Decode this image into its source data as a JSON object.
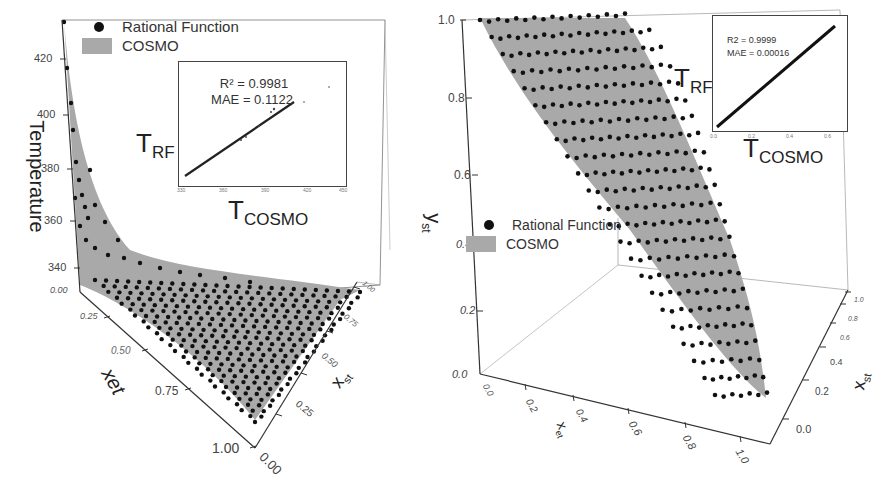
{
  "chart_data": [
    {
      "type": "scatter3d_surface",
      "panel": "left",
      "title": "",
      "zlabel": "Temperature",
      "xlabel": "xet",
      "ylabel": "xst",
      "z_ticks": [
        "340",
        "360",
        "380",
        "400",
        "420"
      ],
      "z_min_label": "0.00",
      "x_ticks": [
        "0.00",
        "0.25",
        "0.50",
        "0.75",
        "1.00"
      ],
      "y_ticks": [
        "0.00",
        "0.25",
        "0.50",
        "0.75",
        "1.00"
      ],
      "zlim": [
        330,
        432
      ],
      "legend": [
        {
          "name": "Rational Function",
          "marker": "dot",
          "color": "#111111"
        },
        {
          "name": "COSMO",
          "marker": "surface",
          "color": "#a9a9a9"
        }
      ],
      "description": "Temperature surface decreasing steeply from ~432 at xet=0, xst=0 toward ~345 plateau; rational function points overlay COSMO surface",
      "inset": {
        "type": "scatter",
        "xlabel": "T_COSMO",
        "ylabel": "T_RF",
        "x_ticks": [
          "330",
          "360",
          "390",
          "420",
          "450"
        ],
        "y_ticks": [
          "390",
          "420",
          "450"
        ],
        "stats": {
          "r2_label": "R² = 0.9981",
          "mae_label": "MAE = 0.1122"
        },
        "r2": 0.9981,
        "mae": 0.1122
      }
    },
    {
      "type": "scatter3d_surface",
      "panel": "right",
      "title": "",
      "zlabel": "yst",
      "xlabel": "xet",
      "ylabel": "xst",
      "z_ticks": [
        "0.0",
        "0.2",
        "0.4",
        "0.6",
        "0.8",
        "1.0"
      ],
      "x_ticks": [
        "0.0",
        "0.2",
        "0.4",
        "0.6",
        "0.8",
        "1.0"
      ],
      "y_ticks": [
        "0.0",
        "0.2",
        "0.4",
        "0.6",
        "0.8",
        "1.0"
      ],
      "zlim": [
        0,
        1
      ],
      "legend": [
        {
          "name": "Rational Function",
          "marker": "dot",
          "color": "#111111"
        },
        {
          "name": "COSMO",
          "marker": "surface",
          "color": "#a9a9a9"
        }
      ],
      "description": "Vapor composition yst surface rising from 0 at xst=0 to 1.0 plateau; rational function points overlay COSMO surface",
      "inset": {
        "type": "scatter",
        "xlabel": "T_COSMO",
        "ylabel": "T_RF",
        "x_ticks": [
          "0.0",
          "0.2",
          "0.4",
          "0.6"
        ],
        "y_ticks": [
          "0.0",
          "0.2",
          "0.4",
          "0.6"
        ],
        "stats": {
          "r2_label": "R2 = 0.9999",
          "mae_label": "MAE = 0.00016"
        },
        "r2": 0.9999,
        "mae": 0.00016
      }
    }
  ],
  "left": {
    "legend": {
      "item1": "Rational Function",
      "item2": "COSMO"
    },
    "z_axis_title": "Temperature",
    "z_ticks": [
      "420",
      "400",
      "380",
      "360",
      "340"
    ],
    "z_min": "0.00",
    "x_axis_title": "xet",
    "x_ticks": [
      "0.25",
      "0.50",
      "0.75",
      "1.00"
    ],
    "y_axis_title": "x",
    "y_axis_sub": "st",
    "y_ticks": [
      "0.00",
      "0.25",
      "0.50",
      "0.75",
      "1.00"
    ],
    "inset": {
      "r2": "R² = 0.9981",
      "mae": "MAE = 0.1122",
      "ylabel_main": "T",
      "ylabel_sub": "RF",
      "xlabel_main": "T",
      "xlabel_sub": "COSMO",
      "x_ticks": [
        "330",
        "360",
        "390",
        "420",
        "450"
      ],
      "y_ticks": [
        "390",
        "420",
        "450"
      ]
    }
  },
  "right": {
    "legend": {
      "item1": "Rational Function",
      "item2": "COSMO"
    },
    "z_axis_title": "y",
    "z_axis_sub": "st",
    "z_ticks": [
      "1.0",
      "0.8",
      "0.6",
      "0.4",
      "0.2",
      "0.0"
    ],
    "x_axis_title": "x",
    "x_axis_sub": "et",
    "x_ticks": [
      "0.0",
      "0.2",
      "0.4",
      "0.6",
      "0.8",
      "1.0"
    ],
    "y_axis_title": "x",
    "y_axis_sub": "st",
    "y_ticks": [
      "0.0",
      "0.2",
      "0.4",
      "0.6",
      "0.8",
      "1.0"
    ],
    "inset": {
      "r2": "R2 = 0.9999",
      "mae": "MAE = 0.00016",
      "ylabel_main": "T",
      "ylabel_sub": "RF",
      "xlabel_main": "T",
      "xlabel_sub": "COSMO",
      "x_ticks": [
        "0.0",
        "0.2",
        "0.4",
        "0.6"
      ],
      "y_ticks": [
        "0.0",
        "0.2",
        "0.4",
        "0.6"
      ]
    }
  },
  "colors": {
    "surface": "#a9a9a9",
    "points": "#111111",
    "axis": "#333333",
    "wall": "#888888"
  }
}
